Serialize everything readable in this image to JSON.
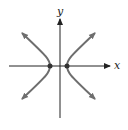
{
  "diagram": {
    "type": "hyperbola-graph",
    "axes": {
      "x_label": "x",
      "y_label": "y"
    },
    "curve": {
      "name": "hyperbola",
      "orientation": "horizontal transverse axis",
      "branches": 2,
      "vertices_marked": true
    },
    "colors": {
      "axis": "#222222",
      "curve": "#6e6e6e",
      "background": "#ffffff"
    }
  }
}
